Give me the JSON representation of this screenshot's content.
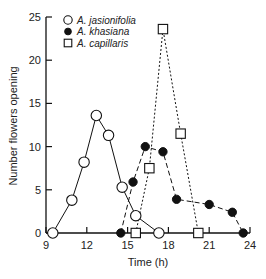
{
  "chart_data": {
    "type": "line",
    "title": "",
    "xlabel": "Time (h)",
    "ylabel": "Number flowers opening",
    "xlim": [
      9,
      24
    ],
    "ylim": [
      0,
      25
    ],
    "xticks": [
      9,
      12,
      15,
      18,
      21,
      24
    ],
    "yticks": [
      0,
      5,
      10,
      15,
      20,
      25
    ],
    "grid": false,
    "legend_position": "upper-left",
    "series": [
      {
        "name": "A. jasionifolia",
        "marker": "open-circle",
        "line": "solid",
        "x": [
          9.5,
          10.9,
          11.8,
          12.7,
          13.6,
          14.6,
          15.6,
          17.3
        ],
        "y": [
          0,
          3.8,
          8.2,
          13.6,
          11.3,
          5.3,
          2.0,
          0
        ]
      },
      {
        "name": "A. khasiana",
        "marker": "filled-circle",
        "line": "dashed",
        "x": [
          14.5,
          15.4,
          16.3,
          17.6,
          18.6,
          21.0,
          22.7,
          23.5
        ],
        "y": [
          0,
          5.9,
          10.0,
          9.4,
          3.9,
          3.3,
          2.4,
          0
        ]
      },
      {
        "name": "A. capillaris",
        "marker": "open-square",
        "line": "dotted",
        "x": [
          15.6,
          16.6,
          17.6,
          18.9,
          20.2
        ],
        "y": [
          0,
          7.5,
          23.6,
          11.5,
          0
        ]
      }
    ]
  },
  "legend": [
    {
      "label": "A. jasionifolia",
      "symbol": "open-circle"
    },
    {
      "label": "A. khasiana",
      "symbol": "filled-circle"
    },
    {
      "label": "A. capillaris",
      "symbol": "open-square"
    }
  ],
  "axes": {
    "x_title": "Time (h)",
    "y_title": "Number flowers opening"
  }
}
